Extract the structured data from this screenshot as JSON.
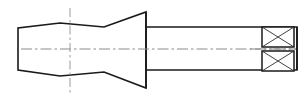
{
  "drawing": {
    "title": "Tapered shank tool — side elevation with sectioned head",
    "type": "engineering-line-drawing",
    "view": "side-elevation-half-section",
    "canvas": {
      "width": 306,
      "height": 101,
      "background": "#ffffff"
    },
    "colors": {
      "outline": "#1a1a1a",
      "centerline": "#8c8c8c",
      "hatch": "#2b2b2b",
      "fill": "#ffffff"
    },
    "axis": {
      "name": "horizontal-centerline",
      "y": 49,
      "x_start": 21,
      "x_end": 296,
      "style": "dash-dot"
    },
    "vertical_centerline": {
      "name": "station-centerline",
      "x": 70,
      "y_start": 8,
      "y_end": 93,
      "style": "dash-dot"
    },
    "body_profile": {
      "name": "tapered-body",
      "description": "Left flange face tapering right through a shallow then steeper cone to the shoulder",
      "points": [
        [
          18,
          28
        ],
        [
          18,
          70
        ],
        [
          60,
          76
        ],
        [
          104,
          72
        ],
        [
          146,
          88
        ],
        [
          146,
          12
        ],
        [
          104,
          27
        ],
        [
          60,
          23
        ]
      ]
    },
    "shaft": {
      "name": "cylindrical-shaft",
      "x": 146,
      "y_top": 27,
      "y_bottom": 70,
      "x_end": 297
    },
    "shoulder": {
      "name": "shoulder-face",
      "x": 146,
      "y_top": 12,
      "y_bottom": 88
    },
    "section_boxes": [
      {
        "name": "section-box-upper",
        "x": 262,
        "y": 27,
        "width": 32,
        "height": 20,
        "hatch": "cross-x"
      },
      {
        "name": "section-box-lower",
        "x": 262,
        "y": 51,
        "width": 32,
        "height": 20,
        "hatch": "cross-x"
      }
    ],
    "end_face": {
      "name": "right-end-face",
      "x": 297,
      "y_top": 27,
      "y_bottom": 70
    }
  }
}
